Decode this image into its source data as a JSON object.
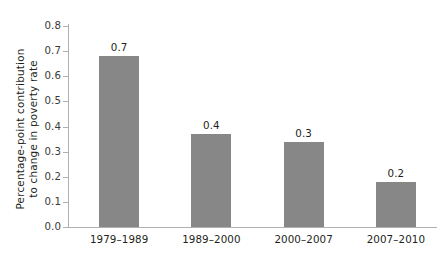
{
  "chart_data": {
    "type": "bar",
    "title": "",
    "subtitle": "",
    "xlabel": "",
    "ylabel_lines": [
      "Percentage-point contribution",
      "to change in poverty rate"
    ],
    "ylabel": "Percentage-point contribution to change in poverty rate",
    "categories": [
      "1979–1989",
      "1989–2000",
      "2000–2007",
      "2007–2010"
    ],
    "values": [
      0.68,
      0.37,
      0.34,
      0.18
    ],
    "data_labels": [
      "0.7",
      "0.4",
      "0.3",
      "0.2"
    ],
    "ylim": [
      0.0,
      0.8
    ],
    "ytick_labels": [
      "0.8",
      "0.7",
      "0.6",
      "0.5",
      "0.4",
      "0.3",
      "0.2",
      "0.1",
      "0.0"
    ],
    "ytick_values": [
      0.8,
      0.7,
      0.6,
      0.5,
      0.4,
      0.3,
      0.2,
      0.1,
      0.0
    ],
    "grid": false,
    "legend": false,
    "legend_position": "none",
    "bar_color": "#878787",
    "axis_color": "#b0b0b0",
    "text_color": "#231f20",
    "background_color": "#ffffff"
  }
}
